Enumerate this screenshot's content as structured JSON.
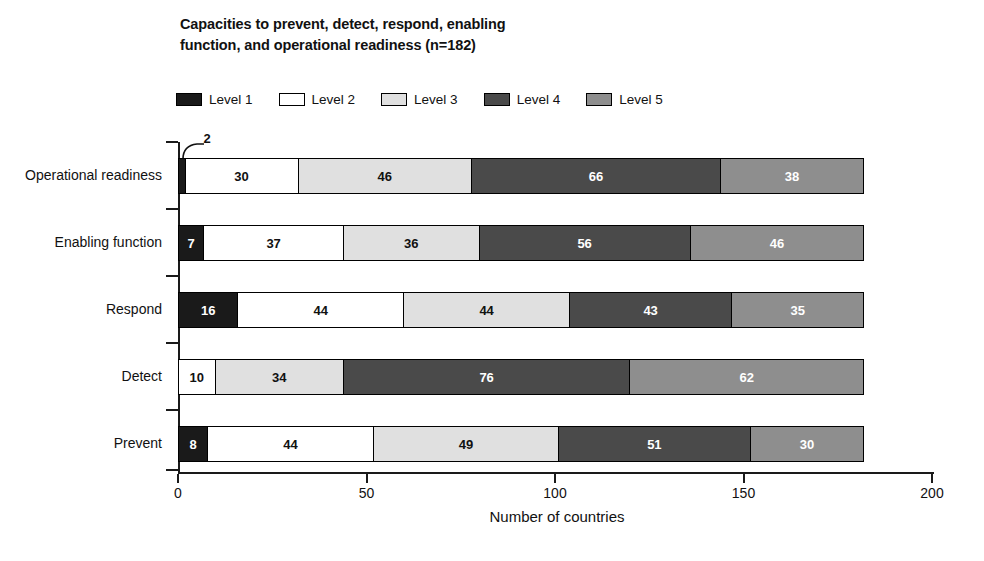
{
  "chart_data": {
    "type": "bar",
    "orientation": "horizontal",
    "stacked": true,
    "title": "Capacities to prevent, detect, respond, enabling function, and operational readiness (n=182)",
    "title_line1": "Capacities to prevent, detect, respond, enabling",
    "title_line2": "function, and operational readiness (n=182)",
    "xlabel": "Number of countries",
    "ylabel": "",
    "xlim": [
      0,
      200
    ],
    "xticks": [
      0,
      50,
      100,
      150,
      200
    ],
    "xtick_labels": [
      "0",
      "50",
      "100",
      "150",
      "200"
    ],
    "grid": false,
    "legend_position": "top",
    "total_per_category": 182,
    "categories": [
      "Operational readiness",
      "Enabling function",
      "Respond",
      "Detect",
      "Prevent"
    ],
    "series": [
      {
        "name": "Level 1",
        "color": "#1a1a1a",
        "values": [
          2,
          7,
          16,
          0,
          8
        ]
      },
      {
        "name": "Level 2",
        "color": "#ffffff",
        "values": [
          30,
          37,
          44,
          10,
          44
        ]
      },
      {
        "name": "Level 3",
        "color": "#e0e0e0",
        "values": [
          46,
          36,
          44,
          34,
          49
        ]
      },
      {
        "name": "Level 4",
        "color": "#4a4a4a",
        "values": [
          66,
          56,
          43,
          76,
          51
        ]
      },
      {
        "name": "Level 5",
        "color": "#8e8e8e",
        "values": [
          38,
          46,
          35,
          62,
          30
        ]
      }
    ]
  },
  "legend": {
    "items": [
      {
        "label": "Level 1"
      },
      {
        "label": "Level 2"
      },
      {
        "label": "Level 3"
      },
      {
        "label": "Level 4"
      },
      {
        "label": "Level 5"
      }
    ]
  },
  "axis": {
    "x_title": "Number of countries"
  },
  "callouts": [
    {
      "category": "Operational readiness",
      "series": "Level 1",
      "value": "2"
    }
  ]
}
